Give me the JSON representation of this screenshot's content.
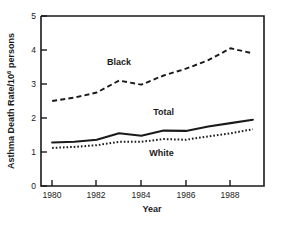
{
  "chart_data": {
    "type": "line",
    "title": "",
    "xlabel": "Year",
    "ylabel": "Asthma Death Rate/10",
    "ylabel_superscript": "6",
    "ylabel_suffix": " persons",
    "x": [
      1980,
      1981,
      1982,
      1983,
      1984,
      1985,
      1986,
      1987,
      1988,
      1989
    ],
    "xlim": [
      1979.5,
      1989.5
    ],
    "ylim": [
      0,
      5
    ],
    "xticks": [
      1980,
      1982,
      1984,
      1986,
      1988
    ],
    "xtick_labels": [
      "1980",
      "1982",
      "1984",
      "1986",
      "1988"
    ],
    "yticks": [
      0,
      1,
      2,
      3,
      4,
      5
    ],
    "ytick_labels": [
      "0",
      "1",
      "2",
      "3",
      "4",
      "5"
    ],
    "grid": false,
    "legend_position": "inline-annotations",
    "series": [
      {
        "name": "Black",
        "style": "dashed",
        "label_x": 1983.0,
        "label_y": 3.55,
        "values": [
          2.5,
          2.6,
          2.75,
          3.1,
          2.98,
          3.25,
          3.45,
          3.7,
          4.05,
          3.9
        ]
      },
      {
        "name": "Total",
        "style": "solid",
        "label_x": 1985.0,
        "label_y": 2.08,
        "values": [
          1.28,
          1.3,
          1.36,
          1.55,
          1.48,
          1.63,
          1.62,
          1.75,
          1.85,
          1.95
        ]
      },
      {
        "name": "White",
        "style": "dotted",
        "label_x": 1984.9,
        "label_y": 0.88,
        "values": [
          1.12,
          1.15,
          1.2,
          1.3,
          1.3,
          1.38,
          1.36,
          1.46,
          1.55,
          1.67
        ]
      }
    ]
  }
}
